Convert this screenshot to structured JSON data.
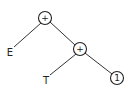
{
  "diagram": {
    "type": "expression-tree",
    "nodes": [
      {
        "id": "root",
        "label": "+",
        "circled": true
      },
      {
        "id": "plus2",
        "label": "+",
        "circled": true
      },
      {
        "id": "E",
        "label": "E",
        "circled": false
      },
      {
        "id": "T",
        "label": "T",
        "circled": false
      },
      {
        "id": "one",
        "label": "1",
        "circled": true
      }
    ],
    "edges": [
      {
        "from": "root",
        "to": "E"
      },
      {
        "from": "root",
        "to": "plus2"
      },
      {
        "from": "plus2",
        "to": "T"
      },
      {
        "from": "plus2",
        "to": "one"
      }
    ]
  }
}
